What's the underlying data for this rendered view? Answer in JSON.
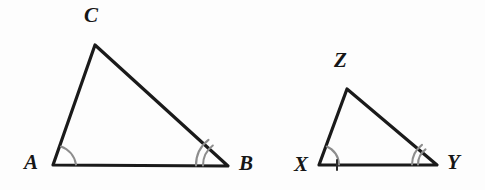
{
  "figure": {
    "background_color": "#fdfdfd",
    "stroke_color": "#1a1a1a",
    "arc_color": "#8d8d8d",
    "label_color": "#161616",
    "width": 485,
    "height": 190
  },
  "triangles": [
    {
      "id": "abc",
      "name": "triangle-abc",
      "size_role": "larger",
      "vertices": [
        {
          "label": "A",
          "x": 53,
          "y": 165,
          "label_x": 24,
          "label_y": 152,
          "arcs": 1
        },
        {
          "label": "B",
          "x": 228,
          "y": 166,
          "label_x": 239,
          "label_y": 153,
          "arcs": 2
        },
        {
          "label": "C",
          "x": 95,
          "y": 45,
          "label_x": 84,
          "label_y": 5,
          "arcs": 0
        }
      ],
      "path": "M 53 165 L 95 45 L 228 166 Z"
    },
    {
      "id": "xyz",
      "name": "triangle-xyz",
      "size_role": "smaller",
      "vertices": [
        {
          "label": "X",
          "x": 319,
          "y": 165,
          "label_x": 294,
          "label_y": 154,
          "arcs": 1
        },
        {
          "label": "Y",
          "x": 437,
          "y": 165,
          "label_x": 447,
          "label_y": 152,
          "arcs": 2
        },
        {
          "label": "Z",
          "x": 347,
          "y": 89,
          "label_x": 334,
          "label_y": 50,
          "arcs": 0
        }
      ],
      "path": "M 319 165 L 347 89 L 437 165 Z"
    }
  ],
  "angle_marks": {
    "single_arc_label": "one-arc",
    "double_arc_label": "two-arc",
    "arcs": [
      {
        "name": "angle-arc-a",
        "d": "M 76 164.5 A 23 23 0 0 0 61.0 146.5"
      },
      {
        "name": "angle-arc-b1",
        "d": "M 203 165.5 A 25 25 0 0 1 212.8 145.5"
      },
      {
        "name": "angle-arc-b2",
        "d": "M 196 165.5 A 32 32 0 0 1 208.5 139.8"
      },
      {
        "name": "angle-arc-x",
        "d": "M 339 164.5 A 20 20 0 0 0 326.8 146.5"
      },
      {
        "name": "angle-arc-y1",
        "d": "M 418 164.5 A 19 19 0 0 1 425.5 149.4"
      },
      {
        "name": "angle-arc-y2",
        "d": "M 412 164.5 A 25 25 0 0 1 422.0 144.8"
      }
    ]
  },
  "tick_marks": [
    {
      "name": "tick-xy-base",
      "x1": 337,
      "y1": 160,
      "x2": 337,
      "y2": 170
    }
  ]
}
